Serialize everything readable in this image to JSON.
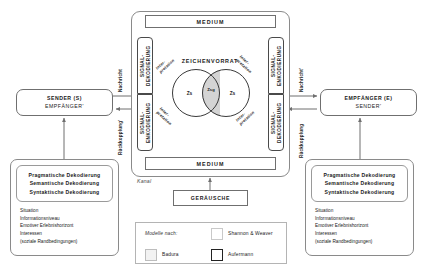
{
  "diagram": {
    "channel": {
      "outer_label": "Kanal",
      "medium_top": "MEDIUM",
      "medium_bottom": "MEDIUM"
    },
    "signal_columns": {
      "left_top": "SIGNAL-\nDEKODIERUNG",
      "left_top_line1": "SIGNAL-",
      "left_top_line2": "DEKODIERUNG",
      "left_bottom_line1": "SIGNAL-",
      "left_bottom_line2": "ENKODIERUNG",
      "right_top_line1": "SIGNAL-",
      "right_top_line2": "ENKODIERUNG",
      "right_bottom_line1": "SIGNAL-",
      "right_bottom_line2": "DEKODIERUNG"
    },
    "zeichenvorrat": {
      "title": "ZEICHENVORRAT",
      "left_circle": "Zs",
      "right_circle": "Zs",
      "intersection": "Zsg"
    },
    "interpretation": {
      "line1": "Inter-",
      "line2": "pretation"
    },
    "sender_box": {
      "line1": "SENDER (S)",
      "line2": "EMPFÄNGER'"
    },
    "receiver_box": {
      "line1": "EMPFÄNGER (E)",
      "line2": "SENDER'"
    },
    "flow_labels": {
      "left_top": "Nachricht",
      "left_bottom": "Rückkopplung'",
      "right_top": "Nachricht'",
      "right_bottom": "Rückkopplung"
    },
    "panel_left": {
      "decoding": [
        "Pragmatische Dekodierung",
        "Semantische Dekodierung",
        "Syntaktische Dekodierung"
      ],
      "attributes": [
        "Situation",
        "Informationsniveau",
        "Emotiver Erlebnishorizont",
        "Interessen",
        "(soziale Randbedingungen)"
      ]
    },
    "panel_right": {
      "decoding": [
        "Pragmatische Dekodierung",
        "Semantische Dekodierung",
        "Syntaktische Dekodierung"
      ],
      "attributes": [
        "Situation",
        "Informationsniveau",
        "Emotiver Erlebnishorizont",
        "Interessen",
        "(soziale Randbedingungen)"
      ]
    },
    "noise_box": "GERÄUSCHE",
    "legend": {
      "title": "Modelle nach:",
      "entries": [
        {
          "label": "Shannon & Weaver",
          "swatch": "light"
        },
        {
          "label": "Badura",
          "swatch": "mid"
        },
        {
          "label": "Aufermann",
          "swatch": "dark"
        }
      ]
    },
    "colors": {
      "line": "#6f6f6f",
      "line_dark": "#3a3a3a",
      "intersection_fill": "#d4d4d4",
      "background": "#ffffff",
      "text": "#1a1a1a"
    }
  }
}
